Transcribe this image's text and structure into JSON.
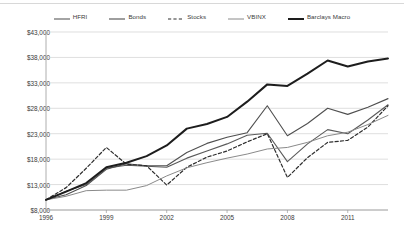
{
  "chart_data": {
    "type": "line",
    "title": "",
    "xlabel": "",
    "ylabel": "",
    "xlim": [
      1996,
      2013
    ],
    "ylim": [
      8000,
      43000
    ],
    "grid": true,
    "legend_position": "top",
    "ytick_labels": [
      "$43,000",
      "$38,000",
      "$33,000",
      "$28,000",
      "$23,000",
      "$18,000",
      "$13,000",
      "$8,000"
    ],
    "ytick_values": [
      43000,
      38000,
      33000,
      28000,
      23000,
      18000,
      13000,
      8000
    ],
    "xtick_labels": [
      "1996",
      "1999",
      "2002",
      "2005",
      "2008",
      "2011"
    ],
    "xtick_values": [
      1996,
      1999,
      2002,
      2005,
      2008,
      2011
    ],
    "x": [
      1996,
      1997,
      1998,
      1999,
      2000,
      2001,
      2002,
      2003,
      2004,
      2005,
      2006,
      2007,
      2008,
      2009,
      2010,
      2011,
      2012,
      2013
    ],
    "series": [
      {
        "name": "HFRI",
        "color": "#5a5a5a",
        "style": "solid",
        "width": 1.1,
        "values": [
          10000,
          11700,
          13000,
          16200,
          16800,
          16600,
          16400,
          18200,
          19600,
          21000,
          22700,
          23100,
          17500,
          21000,
          23800,
          23000,
          25700,
          28700
        ]
      },
      {
        "name": "Bonds",
        "color": "#4f4f4f",
        "style": "solid",
        "width": 1.1,
        "values": [
          10000,
          11000,
          12800,
          16000,
          17100,
          16700,
          16700,
          19300,
          21100,
          22300,
          23200,
          28500,
          22600,
          25000,
          28000,
          26800,
          28200,
          29900
        ]
      },
      {
        "name": "Stocks",
        "color": "#2e2e2e",
        "style": "dashed",
        "width": 1.2,
        "values": [
          10000,
          12400,
          16200,
          20300,
          17000,
          16700,
          12900,
          16400,
          18400,
          19600,
          21400,
          23000,
          14400,
          18300,
          21300,
          21700,
          24300,
          28500
        ]
      },
      {
        "name": "VBINX",
        "color": "#8a8a8a",
        "style": "solid",
        "width": 1.0,
        "values": [
          10000,
          10700,
          11800,
          11900,
          11900,
          12800,
          14700,
          16300,
          17300,
          18200,
          19000,
          20000,
          20300,
          21300,
          22600,
          23300,
          24800,
          26600
        ]
      },
      {
        "name": "Barclays Macro",
        "color": "#1d1d1d",
        "style": "solid",
        "width": 2.0,
        "values": [
          10000,
          11600,
          13300,
          16400,
          17300,
          18600,
          20700,
          24000,
          24900,
          26300,
          29300,
          32700,
          32400,
          34800,
          37400,
          36200,
          37200,
          37800
        ]
      }
    ]
  },
  "legend": {
    "items": [
      {
        "label": "HFRI",
        "icon": "line-solid-icon"
      },
      {
        "label": "Bonds",
        "icon": "line-solid-icon"
      },
      {
        "label": "Stocks",
        "icon": "line-dashed-icon"
      },
      {
        "label": "VBINX",
        "icon": "line-solid-icon"
      },
      {
        "label": "Barclays Macro",
        "icon": "line-thick-icon"
      }
    ]
  }
}
